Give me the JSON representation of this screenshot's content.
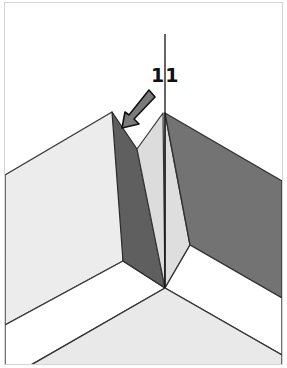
{
  "figure": {
    "step_label": "11",
    "colors": {
      "background": "#ffffff",
      "frame_border": "#d4d4d4",
      "light_panel": "#ececec",
      "mid_panel": "#dedede",
      "dark_fold": "#5f5f5f",
      "dark_panel": "#737373",
      "white_band": "#ffffff",
      "floor_panel": "#e9e9e9",
      "outline": "#333333",
      "arrow_fill": "#7a7a7a",
      "arrow_stroke": "#111111",
      "crease_line": "#111111"
    },
    "icons": {
      "fold_arrow": "arrow-down-left",
      "crease_line": "vertical-line"
    }
  }
}
